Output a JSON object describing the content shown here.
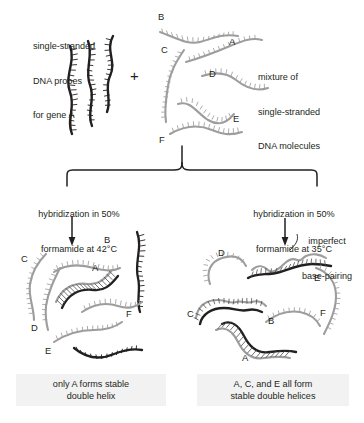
{
  "figure": {
    "title_alt": "DNA hybridization stringency diagram",
    "background_color": "#ffffff",
    "probe_color": "#231f20",
    "target_color": "#9d9d9d",
    "caption_bg": "#f2f2f2"
  },
  "top": {
    "probe_label": "single-stranded\nDNA probes\nfor gene A",
    "probe_label_lines": [
      "single-stranded",
      "DNA probes",
      "for gene A"
    ],
    "plus_sign": "+",
    "mixture_label": "mixture of\nsingle-stranded\nDNA molecules",
    "mixture_label_lines": [
      "mixture of",
      "single-stranded",
      "DNA molecules"
    ],
    "mixture_strand_labels": [
      "B",
      "A",
      "C",
      "D",
      "E",
      "F"
    ]
  },
  "branches": {
    "left": {
      "condition_lines": [
        "hybridization in 50%",
        "formamide at 42°C"
      ],
      "strand_labels": [
        "B",
        "C",
        "A",
        "F",
        "D",
        "E"
      ],
      "caption_lines": [
        "only A forms stable",
        "double helix"
      ]
    },
    "right": {
      "condition_lines": [
        "hybridization in 50%",
        "formamide at 35°C"
      ],
      "annotation_lines": [
        "imperfect",
        "base-pairing"
      ],
      "strand_labels": [
        "D",
        "E",
        "C",
        "B",
        "F",
        "A"
      ],
      "caption_lines": [
        "A, C, and E all form",
        "stable double helices"
      ]
    }
  }
}
